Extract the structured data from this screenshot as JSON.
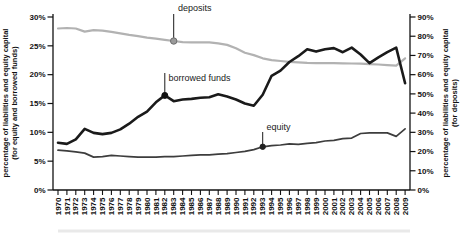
{
  "chart_data": {
    "type": "line",
    "title": "",
    "x_years": [
      1970,
      1971,
      1972,
      1973,
      1974,
      1975,
      1976,
      1977,
      1978,
      1979,
      1980,
      1981,
      1982,
      1983,
      1984,
      1985,
      1986,
      1987,
      1988,
      1989,
      1990,
      1991,
      1992,
      1993,
      1994,
      1995,
      1996,
      1997,
      1998,
      1999,
      2000,
      2001,
      2002,
      2003,
      2004,
      2005,
      2006,
      2007,
      2008,
      2009
    ],
    "left_axis": {
      "title_line1": "percentage of liabilities and equity capital",
      "title_line2": "(for equity and borrowed funds)",
      "tick_labels": [
        "0%",
        "5%",
        "10%",
        "15%",
        "20%",
        "25%",
        "30%"
      ],
      "range": [
        0,
        30
      ]
    },
    "right_axis": {
      "title_line1": "percentage of liabilities and equity capital",
      "title_line2": "(for deposits)",
      "tick_labels": [
        "0%",
        "10%",
        "20%",
        "30%",
        "40%",
        "50%",
        "60%",
        "70%",
        "80%",
        "90%"
      ],
      "range": [
        0,
        90
      ]
    },
    "grid": false,
    "series": [
      {
        "name": "deposits",
        "label": "deposits",
        "axis": "right",
        "color": "#b2b2b2",
        "stroke_width": 2.2,
        "marker_year": 1983,
        "values": [
          84.0,
          84.3,
          84.0,
          82.4,
          83.2,
          82.9,
          82.3,
          81.5,
          80.7,
          80.0,
          79.3,
          78.7,
          78.1,
          77.5,
          76.9,
          76.8,
          76.8,
          76.8,
          76.3,
          75.5,
          73.7,
          71.4,
          70.2,
          68.5,
          67.6,
          67.1,
          66.7,
          66.4,
          66.1,
          66.0,
          66.0,
          66.0,
          65.9,
          65.8,
          65.7,
          65.5,
          65.3,
          65.0,
          64.7,
          68.5
        ]
      },
      {
        "name": "equity",
        "label": "equity",
        "axis": "left",
        "color": "#3d3d3d",
        "stroke_width": 1.7,
        "marker_year": 1993,
        "values": [
          6.9,
          6.8,
          6.6,
          6.4,
          5.7,
          5.8,
          6.0,
          5.9,
          5.8,
          5.7,
          5.7,
          5.7,
          5.8,
          5.8,
          5.9,
          6.0,
          6.1,
          6.1,
          6.2,
          6.3,
          6.5,
          6.7,
          7.0,
          7.5,
          7.7,
          7.8,
          8.0,
          7.9,
          8.1,
          8.2,
          8.5,
          8.6,
          8.9,
          9.0,
          9.8,
          9.9,
          9.9,
          9.9,
          9.3,
          10.6
        ]
      },
      {
        "name": "borrowed_funds",
        "label": "borrowed funds",
        "axis": "left",
        "color": "#1a1a1a",
        "stroke_width": 2.6,
        "marker_year": 1982,
        "values": [
          8.2,
          8.0,
          8.8,
          10.6,
          9.9,
          9.7,
          9.9,
          10.5,
          11.5,
          12.7,
          13.6,
          15.2,
          16.4,
          15.4,
          15.7,
          15.8,
          16.0,
          16.1,
          16.6,
          16.2,
          15.7,
          15.0,
          14.6,
          16.5,
          19.8,
          20.7,
          22.2,
          23.2,
          24.4,
          24.0,
          24.4,
          24.6,
          23.9,
          24.7,
          23.5,
          22.0,
          23.0,
          23.9,
          24.7,
          18.5
        ]
      }
    ]
  }
}
